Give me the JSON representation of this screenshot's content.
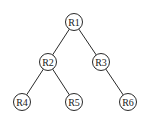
{
  "diagram": {
    "type": "tree",
    "nodes": [
      {
        "id": "R1",
        "label": "R1",
        "x": 74,
        "y": 22
      },
      {
        "id": "R2",
        "label": "R2",
        "x": 48,
        "y": 62
      },
      {
        "id": "R3",
        "label": "R3",
        "x": 101,
        "y": 62
      },
      {
        "id": "R4",
        "label": "R4",
        "x": 22,
        "y": 102
      },
      {
        "id": "R5",
        "label": "R5",
        "x": 74,
        "y": 102
      },
      {
        "id": "R6",
        "label": "R6",
        "x": 128,
        "y": 102
      }
    ],
    "edges": [
      {
        "from": "R1",
        "to": "R2"
      },
      {
        "from": "R1",
        "to": "R3"
      },
      {
        "from": "R2",
        "to": "R4"
      },
      {
        "from": "R2",
        "to": "R5"
      },
      {
        "from": "R3",
        "to": "R6"
      }
    ],
    "node_radius": 8.5,
    "colors": {
      "stroke": "#2a2a2a",
      "fill": "#ffffff",
      "text": "#1a1a1a"
    }
  }
}
